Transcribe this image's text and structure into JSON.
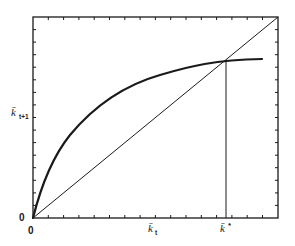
{
  "figure": {
    "type": "phase-diagram",
    "axes": {
      "x_label": "k̄",
      "x_label_sub": "t",
      "y_label": "k̄",
      "y_label_sub": "t+1",
      "x_origin_label": "0",
      "y_origin_label": "0",
      "steady_state_label": "k̄",
      "steady_state_sup": "*"
    },
    "curves": [
      {
        "name": "accumulation-curve",
        "style": "thick",
        "description": "concave curve starting at origin, flattening to the right"
      },
      {
        "name": "45-degree-line",
        "style": "thin",
        "description": "diagonal from origin to top-right corner"
      },
      {
        "name": "steady-state-drop-line",
        "style": "thin",
        "description": "vertical line from intersection down to k*"
      }
    ],
    "colors": {
      "ink": "#1a1a1a",
      "background": "#ffffff"
    }
  }
}
